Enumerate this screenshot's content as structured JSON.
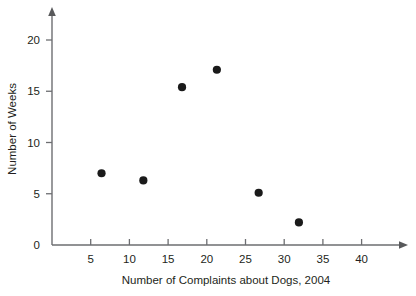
{
  "chart_data": {
    "type": "scatter",
    "title": "",
    "xlabel": "Number of Complaints about Dogs, 2004",
    "ylabel": "Number of Weeks",
    "xlim": [
      0,
      44
    ],
    "ylim": [
      0,
      22.5
    ],
    "xticks": [
      5,
      10,
      15,
      20,
      25,
      30,
      35,
      40
    ],
    "yticks": [
      0,
      5,
      10,
      15,
      20
    ],
    "xtick_labels": [
      "5",
      "10",
      "15",
      "20",
      "25",
      "30",
      "35",
      "40"
    ],
    "ytick_labels": [
      "0",
      "5",
      "10",
      "15",
      "20"
    ],
    "grid": false,
    "legend": false,
    "marker": "filled-circle",
    "marker_color": "#1a1a1a",
    "points": [
      {
        "x": 6.4,
        "y": 7.0
      },
      {
        "x": 11.8,
        "y": 6.3
      },
      {
        "x": 16.8,
        "y": 15.4
      },
      {
        "x": 21.3,
        "y": 17.1
      },
      {
        "x": 26.7,
        "y": 5.1
      },
      {
        "x": 31.9,
        "y": 2.2
      }
    ]
  },
  "axes": {
    "axis_color": "#6d6e71",
    "text_color": "#231f20",
    "x_arrow": "arrow-right-icon",
    "y_arrow": "arrow-up-icon"
  }
}
